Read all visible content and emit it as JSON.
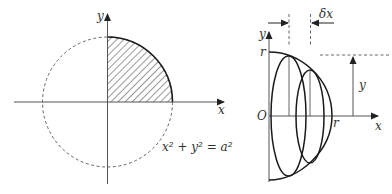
{
  "figure_left": {
    "axis_x_label": "x",
    "axis_y_label": "y",
    "equation": "x² + y² = a²",
    "shaded_region": "first-quadrant quarter disc (hatched)"
  },
  "figure_right": {
    "axis_x_label": "x",
    "axis_y_label": "y",
    "origin_label": "O",
    "radius_label_top": "r",
    "radius_label_right": "r",
    "slice_width_label": "δx",
    "height_label": "y"
  },
  "colors": {
    "stroke": "#1a1a1a",
    "axis": "#555555",
    "dashed": "#555555",
    "text": "#333333",
    "background": "#ffffff"
  }
}
